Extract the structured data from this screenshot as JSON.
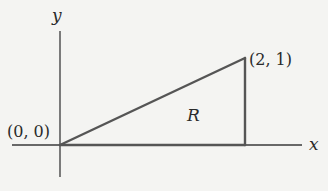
{
  "diagram": {
    "axes": {
      "x_label": "x",
      "y_label": "y"
    },
    "points": {
      "origin": "(0, 0)",
      "vertex": "(2, 1)"
    },
    "region_label": "R",
    "colors": {
      "background": "#f4f4f2",
      "axis": "#3a3a3a",
      "region_edge": "#555555",
      "text": "#2a2a2a"
    }
  }
}
